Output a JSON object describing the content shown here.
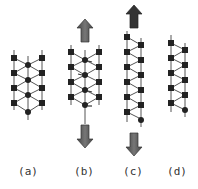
{
  "figure": {
    "panels": [
      {
        "id": "a",
        "label": "(a)",
        "description": "three-strand zigzag chain at rest"
      },
      {
        "id": "b",
        "label": "(b)",
        "description": "three-strand chain under tension with small displacement markers",
        "arrows": [
          "up",
          "down"
        ]
      },
      {
        "id": "c",
        "label": "(c)",
        "description": "two-strand zigzag chain stretched",
        "arrows": [
          "up",
          "down"
        ]
      },
      {
        "id": "d",
        "label": "(d)",
        "description": "two-strand zigzag chain relaxed"
      }
    ]
  },
  "colors": {
    "line": "#555555",
    "node": "#222222",
    "arrow_fill": "#666666",
    "arrow_dark": "#333333",
    "label": "#333333",
    "background": "#ffffff"
  }
}
